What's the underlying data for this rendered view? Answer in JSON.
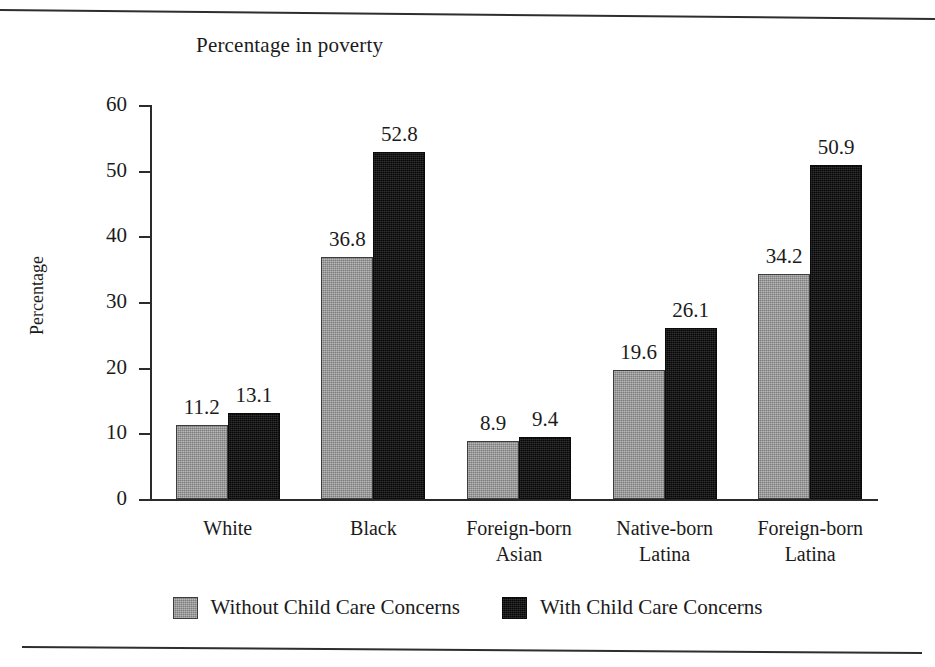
{
  "chart_data": {
    "type": "bar",
    "title": "Percentage in poverty",
    "xlabel": "",
    "ylabel": "Percentage",
    "ylim": [
      0,
      60
    ],
    "yticks": [
      0,
      10,
      20,
      30,
      40,
      50,
      60
    ],
    "grid": false,
    "legend_position": "bottom",
    "categories": [
      "White",
      "Foreign-born Asian",
      "Black",
      "Native-born Latina",
      "Foreign-born Latina"
    ],
    "category_lines": [
      [
        "White"
      ],
      [
        "Black"
      ],
      [
        "Foreign-born",
        "Asian"
      ],
      [
        "Native-born",
        "Latina"
      ],
      [
        "Foreign-born",
        "Latina"
      ]
    ],
    "series": [
      {
        "name": "Without Child Care Concerns",
        "color": "#9a9a9a",
        "values": [
          11.2,
          36.8,
          8.9,
          19.6,
          34.2
        ]
      },
      {
        "name": "With Child Care Concerns",
        "color": "#111111",
        "values": [
          13.1,
          52.8,
          9.4,
          26.1,
          50.9
        ]
      }
    ]
  },
  "legend": {
    "items": [
      {
        "label": "Without Child Care Concerns",
        "swatch": "light"
      },
      {
        "label": "With Child Care Concerns",
        "swatch": "dark"
      }
    ]
  },
  "colors": {
    "light_bar": "#9a9a9a",
    "dark_bar": "#111111",
    "axis": "#2b2b2b",
    "text": "#1b1b1b",
    "background": "#ffffff"
  }
}
